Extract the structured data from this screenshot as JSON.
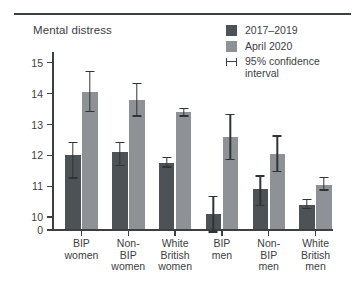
{
  "figure": {
    "title": "Mental distress",
    "axis_break_note": "y-axis starts at 0 then jumps to 10"
  },
  "legend": {
    "position": "top-right",
    "items": [
      {
        "label": "2017–2019",
        "type": "swatch",
        "color": "#4d5256",
        "icon": "square-swatch-icon"
      },
      {
        "label": "April 2020",
        "type": "swatch",
        "color": "#8e9296",
        "icon": "square-swatch-icon"
      },
      {
        "label": "95% confidence interval",
        "type": "errorbar",
        "color": "#3c4043",
        "icon": "error-bar-icon"
      }
    ]
  },
  "chart_data": {
    "type": "bar",
    "title": "Mental distress",
    "xlabel": "",
    "ylabel": "Mental distress",
    "ylim": [
      9.55,
      15.35
    ],
    "yticks": [
      0,
      10,
      11,
      12,
      13,
      14,
      15
    ],
    "ytick_labels": [
      "0",
      "10",
      "11",
      "12",
      "13",
      "14",
      "15"
    ],
    "grid": false,
    "legend_position": "top-right",
    "categories": [
      "BIP women",
      "Non-BIP women",
      "White British women",
      "BIP men",
      "Non-BIP men",
      "White British men"
    ],
    "category_lines": [
      [
        "BIP",
        "women"
      ],
      [
        "Non-",
        "BIP",
        "women"
      ],
      [
        "White",
        "British",
        "women"
      ],
      [
        "BIP",
        "men"
      ],
      [
        "Non-",
        "BIP",
        "men"
      ],
      [
        "White",
        "British",
        "men"
      ]
    ],
    "series": [
      {
        "name": "2017–2019",
        "color": "#4d5256",
        "values": [
          12.0,
          12.1,
          11.75,
          10.1,
          10.9,
          10.4
        ],
        "ci_low": [
          11.25,
          11.65,
          11.6,
          9.5,
          10.35,
          10.25
        ],
        "ci_high": [
          12.45,
          12.45,
          11.95,
          10.7,
          11.35,
          10.6
        ]
      },
      {
        "name": "April 2020",
        "color": "#8e9296",
        "values": [
          14.05,
          13.8,
          13.4,
          12.6,
          12.05,
          11.05
        ],
        "ci_low": [
          13.4,
          13.25,
          13.25,
          11.85,
          11.45,
          10.85
        ],
        "ci_high": [
          14.75,
          14.35,
          13.55,
          13.35,
          12.65,
          11.3
        ]
      }
    ]
  },
  "colors": {
    "series_dark": "#4d5256",
    "series_light": "#8e9296",
    "axis": "#3c4043",
    "background": "#ffffff"
  }
}
